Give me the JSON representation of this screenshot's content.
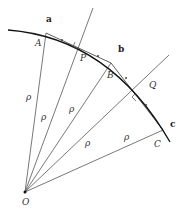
{
  "diagram": {
    "title": "",
    "origin": {
      "label": "O",
      "x": 25,
      "y": 192
    },
    "radius_label": "ρ",
    "arc_points": {
      "a": {
        "label": "a",
        "x": 46,
        "y": 22
      },
      "b": {
        "label": "b",
        "x": 118,
        "y": 52
      },
      "c": {
        "label": "c",
        "x": 170,
        "y": 127
      }
    },
    "points": {
      "A": {
        "label": "A",
        "x": 37,
        "y": 46
      },
      "P": {
        "label": "P",
        "x": 82,
        "y": 58
      },
      "B": {
        "label": "B",
        "x": 108,
        "y": 76
      },
      "Q": {
        "label": "Q",
        "x": 150,
        "y": 86
      },
      "C": {
        "label": "C",
        "x": 155,
        "y": 145
      }
    },
    "rho_labels": [
      {
        "label": "ρ",
        "x": 26,
        "y": 100
      },
      {
        "label": "ρ",
        "x": 42,
        "y": 117
      },
      {
        "label": "ρ",
        "x": 70,
        "y": 112
      },
      {
        "label": "ρ",
        "x": 84,
        "y": 145
      },
      {
        "label": "ρ",
        "x": 125,
        "y": 142
      }
    ],
    "colors": {
      "line": "#444444",
      "arc": "#111111"
    }
  }
}
